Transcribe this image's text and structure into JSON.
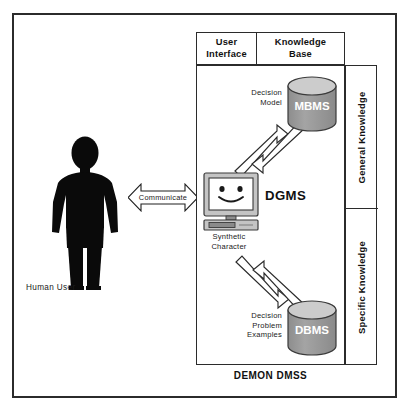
{
  "diagram": {
    "caption": "DEMON DMSS",
    "actor": {
      "label": "Human User",
      "icon": "person-silhouette-icon"
    },
    "communication": {
      "label": "Communicate",
      "icon": "double-headed-arrow-icon"
    },
    "panel_headers": {
      "user_interface": "User\nInterface",
      "user_interface_line1": "User",
      "user_interface_line2": "Interface",
      "knowledge_base_line1": "Knowledge",
      "knowledge_base_line2": "Base"
    },
    "knowledge_columns": [
      {
        "label": "General Knowledge"
      },
      {
        "label": "Specific Knowledge"
      }
    ],
    "nodes": [
      {
        "id": "mbms",
        "type": "cylinder",
        "label": "MBMS",
        "caption_line1": "Decision",
        "caption_line2": "Model",
        "fill": "#9a9a9a",
        "top_fill": "#c9c9c9"
      },
      {
        "id": "dgms",
        "type": "computer",
        "label": "DGMS",
        "caption_line1": "Synthetic",
        "caption_line2": "Character",
        "face": "smiley-face-icon",
        "fill": "#c4c4c4"
      },
      {
        "id": "dbms",
        "type": "cylinder",
        "label": "DBMS",
        "caption_line1": "Decision",
        "caption_line2": "Problem",
        "caption_line3": "Examples",
        "fill": "#9a9a9a",
        "top_fill": "#c9c9c9"
      }
    ],
    "connectors": [
      {
        "id": "dgms-to-mbms",
        "direction": "up-right",
        "style": "block-arrow"
      },
      {
        "id": "mbms-to-dgms",
        "direction": "down-left",
        "style": "block-arrow"
      },
      {
        "id": "dgms-to-dbms",
        "direction": "down-right",
        "style": "block-arrow"
      },
      {
        "id": "dbms-to-dgms",
        "direction": "up-left",
        "style": "block-arrow"
      }
    ],
    "colors": {
      "frame": "#2b2b2b",
      "background": "#ffffff",
      "silhouette": "#0a0a0a",
      "cylinder_body": "#9a9a9a",
      "cylinder_top": "#c9c9c9",
      "monitor": "#c4c4c4",
      "text": "#111111"
    }
  }
}
